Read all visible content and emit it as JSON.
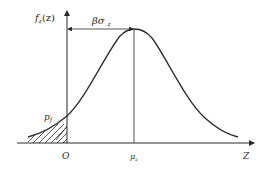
{
  "diagram": {
    "type": "normal distribution with failure probability region",
    "labels": {
      "y_axis": "f",
      "y_axis_sub": "z",
      "y_axis_arg": "(z)",
      "beta_sigma": "βσ",
      "beta_sigma_sub": "z",
      "pf": "p",
      "pf_sub": "f",
      "origin": "O",
      "mu": "μ",
      "mu_sub": "z",
      "x_axis": "Z"
    },
    "colors": {
      "line": "#2a2a2a",
      "background": "#ffffff"
    }
  }
}
